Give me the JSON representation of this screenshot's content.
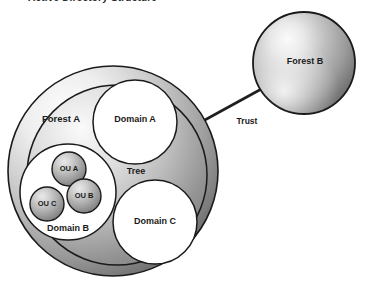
{
  "diagram": {
    "title": "Active Directory Structure",
    "forest_a": {
      "label": "Forest A"
    },
    "forest_b": {
      "label": "Forest B"
    },
    "tree": {
      "label": "Tree"
    },
    "trust": {
      "label": "Trust"
    },
    "domains": [
      {
        "id": "domain-a",
        "label": "Domain A"
      },
      {
        "id": "domain-b",
        "label": "Domain B"
      },
      {
        "id": "domain-c",
        "label": "Domain C"
      }
    ],
    "organizational_units": [
      {
        "id": "ou-a",
        "label": "OU A"
      },
      {
        "id": "ou-b",
        "label": "OU B"
      },
      {
        "id": "ou-c",
        "label": "OU C"
      }
    ],
    "colors": {
      "outline": "#1a1a1a",
      "sphere_light": "#f2f2f2",
      "sphere_mid": "#b5b5b5",
      "sphere_dark": "#6e6e6e",
      "domain_fill": "#ffffff",
      "background": "#ffffff",
      "text": "#1a1a1a"
    }
  }
}
